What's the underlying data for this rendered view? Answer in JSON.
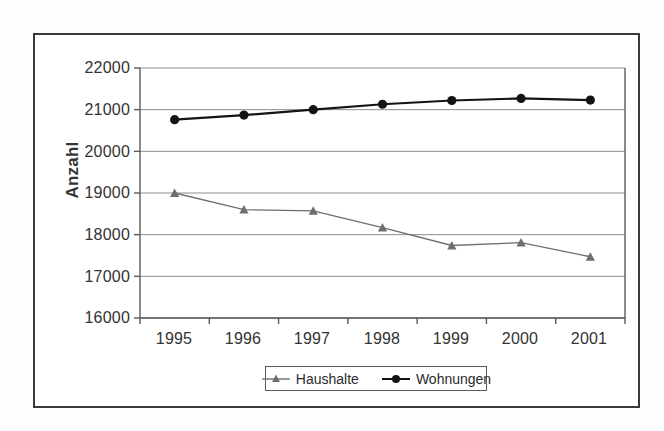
{
  "chart_data": {
    "type": "line",
    "title": "",
    "xlabel": "",
    "ylabel": "Anzahl",
    "categories": [
      "1995",
      "1996",
      "1997",
      "1998",
      "1999",
      "2000",
      "2001"
    ],
    "ylim": [
      16000,
      22000
    ],
    "ytick_step": 1000,
    "yticks": [
      "22000",
      "21000",
      "20000",
      "19000",
      "18000",
      "17000",
      "16000"
    ],
    "grid": true,
    "grid_axis": "y",
    "legend_position": "bottom-center",
    "series": [
      {
        "name": "Haushalte",
        "values": [
          19000,
          18600,
          18570,
          18170,
          17740,
          17810,
          17470
        ],
        "color": "#6e6e6e",
        "marker": "triangle"
      },
      {
        "name": "Wohnungen",
        "values": [
          20760,
          20870,
          21000,
          21130,
          21220,
          21270,
          21230
        ],
        "color": "#141414",
        "marker": "circle"
      }
    ]
  },
  "axis": {
    "y_label": "Anzahl"
  },
  "legend": {
    "items": [
      {
        "label": "Haushalte"
      },
      {
        "label": "Wohnungen"
      }
    ]
  },
  "colors": {
    "haushalte": "#6e6e6e",
    "wohnungen": "#141414",
    "gridline": "#8d8d8d",
    "axis": "#5a5a5a",
    "frame": "#3a3a3a"
  }
}
